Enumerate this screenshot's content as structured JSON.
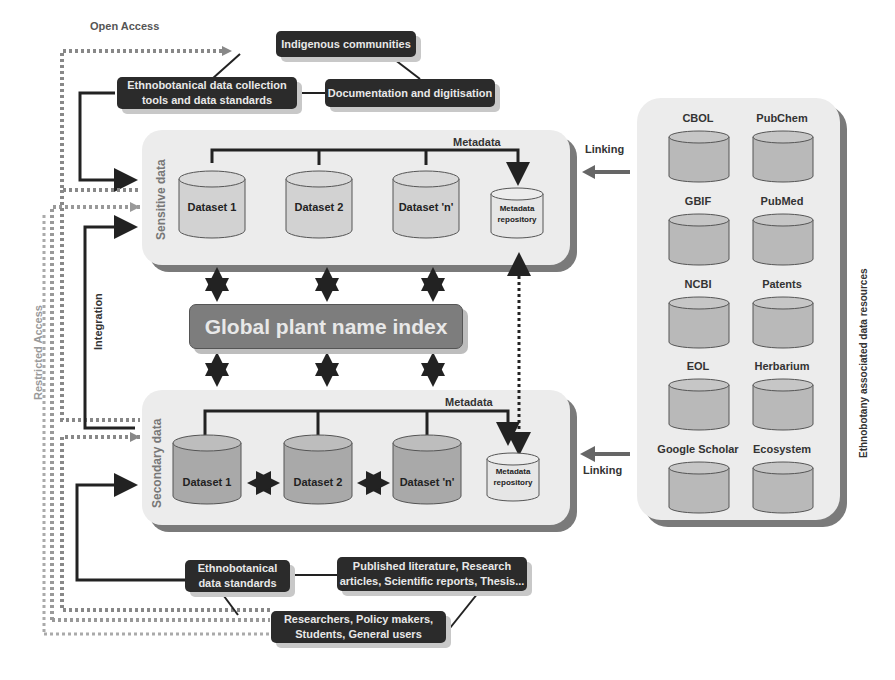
{
  "access": {
    "open": "Open Access",
    "restricted": "Restricted Access"
  },
  "top_boxes": {
    "indigenous": "Indigenous communities",
    "tools_line1": "Ethnobotanical data collection",
    "tools_line2": "tools and data standards",
    "documentation": "Documentation and digitisation"
  },
  "sensitive": {
    "title": "Sensitive data",
    "metadata_label": "Metadata",
    "datasets": [
      "Dataset 1",
      "Dataset 2",
      "Dataset 'n'"
    ],
    "repo_line1": "Metadata",
    "repo_line2": "repository"
  },
  "gpni": "Global plant name index",
  "integration": "Integration",
  "secondary": {
    "title": "Secondary data",
    "metadata_label": "Metadata",
    "datasets": [
      "Dataset 1",
      "Dataset 2",
      "Dataset 'n'"
    ],
    "repo_line1": "Metadata",
    "repo_line2": "repository"
  },
  "linking": [
    "Linking",
    "Linking"
  ],
  "resources": {
    "title": "Ethnobotany associated data resources",
    "items": [
      "CBOL",
      "PubChem",
      "GBIF",
      "PubMed",
      "NCBI",
      "Patents",
      "EOL",
      "Herbarium",
      "Google Scholar",
      "Ecosystem"
    ]
  },
  "bottom_boxes": {
    "standards_line1": "Ethnobotanical",
    "standards_line2": "data standards",
    "literature_line1": "Published literature, Research",
    "literature_line2": "articles, Scientific reports, Thesis...",
    "users_line1": "Researchers, Policy makers,",
    "users_line2": "Students, General users"
  },
  "colors": {
    "dark_box": "#2b2b2b",
    "panel": "#ececec",
    "cylinder_sensitive": "#d2d2d2",
    "cylinder_secondary": "#a9a9a9",
    "gpni": "#7d7d7d"
  }
}
